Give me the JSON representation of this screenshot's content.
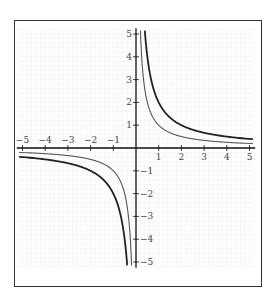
{
  "chart_data": {
    "type": "line",
    "title": "",
    "xlabel": "",
    "ylabel": "",
    "xlim": [
      -5.2,
      5.2
    ],
    "ylim": [
      -5.2,
      5.2
    ],
    "grid": true,
    "legend": null,
    "x_ticks": [
      -5,
      -4,
      -3,
      -2,
      -1,
      1,
      2,
      3,
      4,
      5
    ],
    "x_tick_labels": [
      "−5",
      "−4",
      "−3",
      "−2",
      "−1",
      "1",
      "2",
      "3",
      "4",
      "5"
    ],
    "y_ticks": [
      5,
      4,
      3,
      2,
      1,
      -1,
      -2,
      -3,
      -4,
      -5
    ],
    "y_tick_labels": [
      "5",
      "4",
      "3",
      "2",
      "1",
      "−1",
      "−2",
      "−3",
      "−4",
      "−5"
    ],
    "series": [
      {
        "name": "y = 2/x",
        "style": "thick",
        "color": "#222222",
        "x": [
          -5,
          -4,
          -3,
          -2,
          -1.5,
          -1,
          -0.75,
          -0.5,
          -0.4,
          0.4,
          0.5,
          0.75,
          1,
          1.5,
          2,
          3,
          4,
          5
        ],
        "y": [
          -0.4,
          -0.5,
          -0.667,
          -1,
          -1.333,
          -2,
          -2.667,
          -4,
          -5,
          5,
          4,
          2.667,
          2,
          1.333,
          1,
          0.667,
          0.5,
          0.4
        ]
      },
      {
        "name": "y = 1/x",
        "style": "thin",
        "color": "#555555",
        "x": [
          -5,
          -4,
          -3,
          -2,
          -1.5,
          -1,
          -0.75,
          -0.5,
          -0.4,
          -0.3,
          -0.2,
          0.2,
          0.3,
          0.4,
          0.5,
          0.75,
          1,
          1.5,
          2,
          3,
          4,
          5
        ],
        "y": [
          -0.2,
          -0.25,
          -0.333,
          -0.5,
          -0.667,
          -1,
          -1.333,
          -2,
          -2.5,
          -3.333,
          -5,
          5,
          3.333,
          2.5,
          2,
          1.333,
          1,
          0.667,
          0.5,
          0.333,
          0.25,
          0.2
        ]
      }
    ]
  },
  "layout": {
    "origin_px": [
      136,
      148
    ],
    "unit_x_px": 22.7,
    "unit_y_px": 22.8,
    "grid_color": "#eeeeee",
    "axis_color": "#111111",
    "frame_color": "#333333"
  }
}
